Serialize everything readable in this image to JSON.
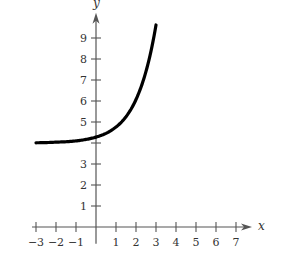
{
  "chart_data": {
    "type": "line",
    "title": "",
    "xlabel": "x",
    "ylabel": "y",
    "xlim": [
      -3.2,
      7.8
    ],
    "ylim": [
      -0.8,
      10.2
    ],
    "grid": false,
    "x_ticks": [
      -3,
      -2,
      -1,
      1,
      2,
      3,
      4,
      5,
      6,
      7
    ],
    "x_tick_labels": [
      "−3",
      "−2",
      "−1",
      "1",
      "2",
      "3",
      "4",
      "5",
      "6",
      "7"
    ],
    "y_ticks": [
      1,
      2,
      3,
      4,
      5,
      6,
      7,
      8,
      9
    ],
    "y_tick_labels": [
      "1",
      "2",
      "3",
      "",
      "5",
      "6",
      "7",
      "8",
      "9"
    ],
    "series": [
      {
        "name": "exponential curve",
        "x": [
          -3,
          -2.5,
          -2,
          -1.5,
          -1,
          -0.5,
          0,
          0.5,
          1,
          1.5,
          2,
          2.5,
          3
        ],
        "values": [
          4.01,
          4.02,
          4.04,
          4.06,
          4.1,
          4.17,
          4.28,
          4.46,
          4.76,
          5.25,
          6.07,
          7.41,
          9.62
        ]
      }
    ]
  },
  "layout": {
    "origin_px": [
      96,
      227
    ],
    "px_per_unit_x": 20.0,
    "px_per_unit_y": 21.0,
    "colors": {
      "axis": "#555555",
      "curve": "#000000",
      "text": "#333333"
    }
  }
}
